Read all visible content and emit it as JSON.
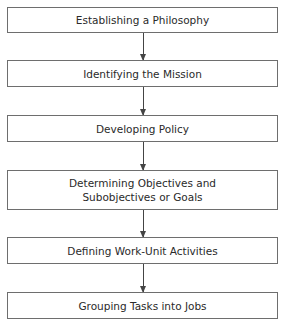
{
  "diagram": {
    "type": "vertical-flowchart",
    "steps": [
      {
        "label": "Establishing a Philosophy"
      },
      {
        "label": "Identifying the Mission"
      },
      {
        "label": "Developing Policy"
      },
      {
        "label_line1": "Determining Objectives and",
        "label_line2": "Subobjectives or Goals"
      },
      {
        "label": "Defining Work-Unit Activities"
      },
      {
        "label": "Grouping Tasks into Jobs"
      }
    ],
    "connectors": [
      {
        "from": 0,
        "to": 1
      },
      {
        "from": 1,
        "to": 2
      },
      {
        "from": 2,
        "to": 3
      },
      {
        "from": 3,
        "to": 4
      },
      {
        "from": 4,
        "to": 5
      }
    ],
    "colors": {
      "border": "#6e6e6e",
      "arrow": "#444444",
      "text": "#2a2a2a",
      "background": "#ffffff"
    }
  }
}
